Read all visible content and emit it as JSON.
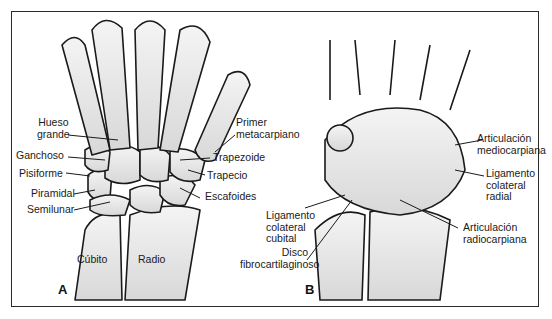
{
  "figure": {
    "panels": [
      {
        "id": "A",
        "letter": "A",
        "labels": {
          "hueso_grande_1": "Hueso",
          "hueso_grande_2": "grande",
          "ganchoso": "Ganchoso",
          "pisiforme": "Pisiforme",
          "piramidal": "Piramidal",
          "semilunar": "Semilunar",
          "primer_meta_1": "Primer",
          "primer_meta_2": "metacarpiano",
          "trapezoide": "Trapezoide",
          "trapecio": "Trapecio",
          "escafoides": "Escafoides",
          "cubito": "Cúbito",
          "radio": "Radio"
        }
      },
      {
        "id": "B",
        "letter": "B",
        "labels": {
          "art_medio_1": "Articulación",
          "art_medio_2": "mediocarpiana",
          "lig_radial_1": "Ligamento",
          "lig_radial_2": "colateral",
          "lig_radial_3": "radial",
          "lig_cubital_1": "Ligamento",
          "lig_cubital_2": "colateral",
          "lig_cubital_3": "cubital",
          "disco_1": "Disco",
          "disco_2": "fibrocartilaginoso",
          "art_radio_1": "Articulación",
          "art_radio_2": "radiocarpiana"
        }
      }
    ],
    "colors": {
      "line": "#1a1a1a",
      "bone_fill": "#e4e4e4",
      "background": "#ffffff"
    }
  }
}
